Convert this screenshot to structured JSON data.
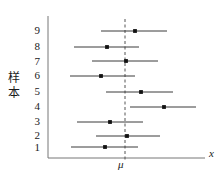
{
  "chart_data": {
    "type": "scatter",
    "title": "",
    "subtitle": "",
    "xlabel": "x",
    "ylabel": "样本",
    "ylabel_chars": [
      "样",
      "本"
    ],
    "grid": false,
    "legend": null,
    "orientation": "horizontal",
    "categories": [
      "1",
      "2",
      "3",
      "4",
      "5",
      "6",
      "7",
      "8",
      "9"
    ],
    "ytick_labels": [
      "9",
      "8",
      "7",
      "6",
      "5",
      "4",
      "3",
      "2",
      "1"
    ],
    "xlim": [
      48,
      205
    ],
    "ylim": [
      0.5,
      9.5
    ],
    "reference_line": {
      "label": "μ",
      "x": 125,
      "style": "dashed",
      "color": "#555555"
    },
    "axes": {
      "y_axis_x": 48,
      "x_axis_y": 158,
      "x_axis_end": 205,
      "y_axis_top": 16,
      "color": "#777777"
    },
    "series": [
      {
        "name": "confidence-intervals",
        "color": "#3a3a3a",
        "marker_color": "#111111",
        "points": [
          {
            "sample": "9",
            "y": 31,
            "low": 101,
            "estimate": 135,
            "high": 167,
            "contains_mu": true
          },
          {
            "sample": "8",
            "y": 47,
            "low": 74,
            "estimate": 107,
            "high": 139,
            "contains_mu": true
          },
          {
            "sample": "7",
            "y": 61,
            "low": 92,
            "estimate": 126,
            "high": 158,
            "contains_mu": true
          },
          {
            "sample": "6",
            "y": 76,
            "low": 70,
            "estimate": 101,
            "high": 135,
            "contains_mu": true
          },
          {
            "sample": "5",
            "y": 92,
            "low": 106,
            "estimate": 141,
            "high": 173,
            "contains_mu": true
          },
          {
            "sample": "4",
            "y": 107,
            "low": 130,
            "estimate": 164,
            "high": 196,
            "contains_mu": false
          },
          {
            "sample": "3",
            "y": 122,
            "low": 77,
            "estimate": 110,
            "high": 143,
            "contains_mu": true
          },
          {
            "sample": "2",
            "y": 136,
            "low": 96,
            "estimate": 127,
            "high": 160,
            "contains_mu": true
          },
          {
            "sample": "1",
            "y": 147,
            "low": 71,
            "estimate": 105,
            "high": 138,
            "contains_mu": true
          }
        ]
      }
    ]
  },
  "labels": {
    "mu": "μ",
    "x": "x",
    "y_char_top": "样",
    "y_char_bottom": "本",
    "tick_9": "9",
    "tick_8": "8",
    "tick_7": "7",
    "tick_6": "6",
    "tick_5": "5",
    "tick_4": "4",
    "tick_3": "3",
    "tick_2": "2",
    "tick_1": "1"
  },
  "colors": {
    "axis": "#777777",
    "interval": "#3a3a3a",
    "marker": "#111111",
    "dashed": "#555555",
    "text": "#1a1a1a",
    "background": "#ffffff"
  }
}
